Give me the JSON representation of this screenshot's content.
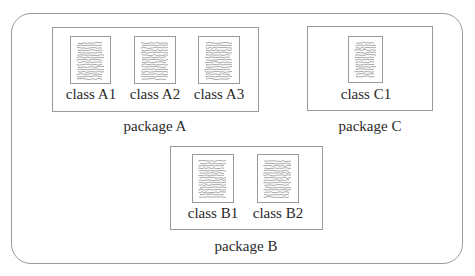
{
  "diagram": {
    "packages": [
      {
        "id": "A",
        "label": "package A",
        "classes": [
          {
            "label": "class A1"
          },
          {
            "label": "class A2"
          },
          {
            "label": "class A3"
          }
        ]
      },
      {
        "id": "C",
        "label": "package C",
        "classes": [
          {
            "label": "class C1"
          }
        ]
      },
      {
        "id": "B",
        "label": "package B",
        "classes": [
          {
            "label": "class B1"
          },
          {
            "label": "class B2"
          }
        ]
      }
    ]
  },
  "colors": {
    "border": "#9a9a9a",
    "text": "#2a2a2a",
    "doc_lines": "#555555"
  }
}
